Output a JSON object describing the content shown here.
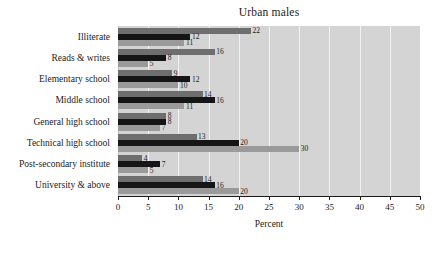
{
  "chart_data": {
    "type": "bar",
    "orientation": "horizontal",
    "title": "Urban males",
    "xlabel": "Percent",
    "ylabel": "",
    "xlim": [
      0,
      50
    ],
    "xticks": [
      0,
      5,
      10,
      15,
      20,
      25,
      30,
      35,
      40,
      45,
      50
    ],
    "grid": true,
    "legend": "none",
    "categories": [
      "Illiterate",
      "Reads & writes",
      "Elementary school",
      "Middle school",
      "General high school",
      "Technical high school",
      "Post-secondary institute",
      "University & above"
    ],
    "series": [
      {
        "name": "series-1",
        "color": "#6e6e6e",
        "values": [
          22,
          16,
          9,
          14,
          8,
          13,
          4,
          14
        ]
      },
      {
        "name": "series-2",
        "color": "#151515",
        "values": [
          12,
          8,
          12,
          16,
          8,
          20,
          7,
          16
        ]
      },
      {
        "name": "series-3",
        "color": "#9a9a9a",
        "values": [
          11,
          5,
          10,
          11,
          7,
          30,
          5,
          20
        ]
      }
    ],
    "value_labels": [
      [
        "22",
        "12",
        "11"
      ],
      [
        "16",
        "8",
        "5"
      ],
      [
        "9",
        "12",
        "10"
      ],
      [
        "14",
        "16",
        "11"
      ],
      [
        "8",
        "8",
        "7"
      ],
      [
        "13",
        "20",
        "30"
      ],
      [
        "4",
        "7",
        "5"
      ],
      [
        "14",
        "16",
        "20"
      ]
    ],
    "colors": {
      "plot_background": "#d4d4d4",
      "gridline": "#f2f2f2",
      "axis": "#1b1b1b",
      "text": "#1b1b1b"
    }
  }
}
